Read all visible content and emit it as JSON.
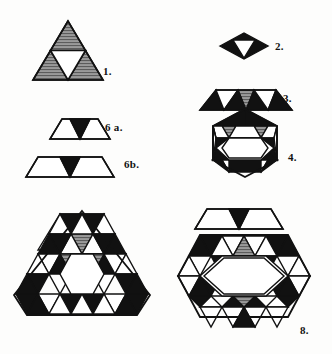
{
  "plate": {
    "title": "Geometric tiling figures plate",
    "background_color": "#fdfdfc",
    "stroke_color": "#111111",
    "fill_black": "#111111",
    "fill_gray": "#8a8a8a",
    "fill_white": "#ffffff",
    "figure_count": 8
  },
  "labels": {
    "fig1": "1.",
    "fig2": "2.",
    "fig3": "3.",
    "fig4": "4.",
    "fig6a": "6 a.",
    "fig6b": "6b.",
    "fig7": "7.",
    "fig8": "8."
  },
  "figures": [
    {
      "id": "fig1",
      "label": "1.",
      "shape": "triangle",
      "description": "Equilateral triangle subdivided into four triangles: three gray-hatched corner triangles and a white hexagonal centre formed by the inverted middle triangle",
      "corner_fills": [
        "gray",
        "gray",
        "gray"
      ],
      "centre_fill": "white",
      "centre_shape": "hexagon"
    },
    {
      "id": "fig2",
      "label": "2.",
      "shape": "rhombus",
      "description": "Small black rhombus (two triangles) with a white triangular notch at the centre pointing down",
      "fills": [
        "black",
        "white"
      ]
    },
    {
      "id": "fig3",
      "label": "3.",
      "shape": "trapezoid",
      "description": "Trapezoid built from black corner triangles, white triangles and a single gray-hatched inverted triangle at the centre",
      "fills": [
        "black",
        "white",
        "gray",
        "white",
        "black"
      ]
    },
    {
      "id": "fig4",
      "label": "4.",
      "shape": "hexagon",
      "description": "Hexagon ring of six trapezoids: alternating black and gray-hatched triangles around a white hexagonal centre",
      "ring_count": 6,
      "centre_fill": "white",
      "centre_shape": "hexagon"
    },
    {
      "id": "fig6a",
      "label": "6 a.",
      "shape": "trapezoid-small",
      "description": "Small trapezoid: two white triangles flanking one black inverted triangle",
      "fills": [
        "white",
        "black",
        "white"
      ]
    },
    {
      "id": "fig6b",
      "label": "6b.",
      "shape": "trapezoid-wide",
      "description": "Wide trapezoid: two large white triangles flanking one black inverted triangle",
      "fills": [
        "white",
        "black",
        "white"
      ]
    },
    {
      "id": "fig7",
      "label": "7.",
      "shape": "triangle-compound",
      "description": "Large compound triangle assembled from trapezoid and triangle units with black, gray-hatched and white cells around a white hexagonal centre",
      "centre_fill": "white",
      "centre_shape": "hexagon"
    },
    {
      "id": "fig8",
      "label": "8.",
      "shape": "hexagon-compound",
      "description": "Large compound hexagon assembled from the same units around a white hexagonal centre, with a wide trapezoid (unit 6b) placed above it",
      "centre_fill": "white",
      "centre_shape": "hexagon",
      "has_detached_trapezoid_above": true
    }
  ]
}
